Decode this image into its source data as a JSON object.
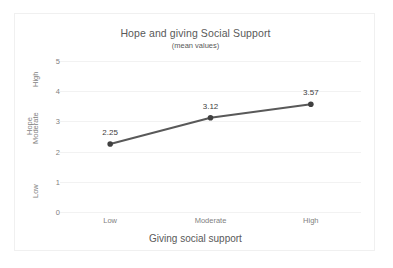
{
  "chart_data": {
    "type": "line",
    "title": "Hope and giving Social Support",
    "subtitle": "(mean values)",
    "xlabel": "Giving social support",
    "ylabel": "Hope",
    "categories": [
      "Low",
      "Moderate",
      "High"
    ],
    "values": [
      2.25,
      3.12,
      3.57
    ],
    "point_labels": [
      "2.25",
      "3.12",
      "3.57"
    ],
    "ylim": [
      0,
      5
    ],
    "y_ticks": [
      "0",
      "1",
      "2",
      "3",
      "4",
      "5"
    ],
    "y_tick_values": [
      0,
      1,
      2,
      3,
      4,
      5
    ],
    "y_category_labels": [
      {
        "label": "Low",
        "value": 0.75
      },
      {
        "label": "Moderate",
        "value": 2.55
      },
      {
        "label": "High",
        "value": 4.45
      }
    ],
    "series": [
      {
        "name": "Hope",
        "values": [
          2.25,
          3.12,
          3.57
        ]
      }
    ],
    "grid": true,
    "grid_axis": "y",
    "legend": false,
    "legend_position": "none",
    "marker": "circle",
    "colors": {
      "line": "#595959",
      "marker": "#404040",
      "gridline": "#f2f2f2",
      "axis_text": "#7f7f7f",
      "title_text": "#595959",
      "label_text": "#404040",
      "frame_border": "#f0f0f0",
      "background": "#ffffff"
    }
  }
}
